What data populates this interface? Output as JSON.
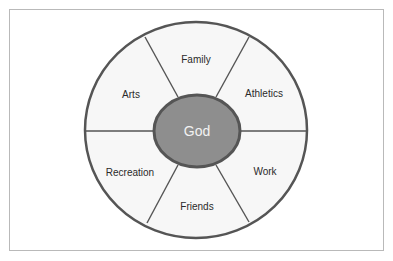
{
  "diagram": {
    "type": "wheel",
    "center": {
      "label": "God",
      "fill": "#8e8e8e"
    },
    "segments": [
      {
        "label": "Family"
      },
      {
        "label": "Athletics"
      },
      {
        "label": "Work"
      },
      {
        "label": "Friends"
      },
      {
        "label": "Recreation"
      },
      {
        "label": "Arts"
      }
    ],
    "colors": {
      "stroke": "#555555",
      "segment_fill": "#f7f7f7",
      "frame": "#b9b9b9"
    }
  }
}
